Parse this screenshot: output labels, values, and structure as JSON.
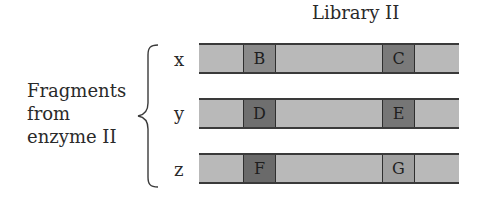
{
  "title": "Library II",
  "group_label": [
    "Fragments",
    "from",
    "enzyme II"
  ],
  "rows": [
    {
      "label": "x",
      "box1": "B",
      "box2": "C",
      "box1_color": "#8a8a8a",
      "box2_color": "#7a7a7a"
    },
    {
      "label": "y",
      "box1": "D",
      "box2": "E",
      "box1_color": "#6f6f6f",
      "box2_color": "#767676"
    },
    {
      "label": "z",
      "box1": "F",
      "box2": "G",
      "box1_color": "#6a6a6a",
      "box2_color": "#a0a0a0"
    }
  ],
  "colors": {
    "bar_fill": "#b9b9b9",
    "bar_border": "#3a3a3a"
  }
}
